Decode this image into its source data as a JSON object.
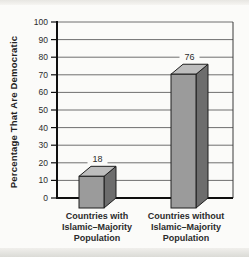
{
  "figure": {
    "background": "#fbfbf9",
    "scan_edge_top_color": "#e7e6e2",
    "scan_edge_bottom_color": "#dbdbd6"
  },
  "chart_data": {
    "type": "bar",
    "style": "3d-column",
    "title": "",
    "xlabel": "",
    "ylabel": "Percentage That Are Democratic",
    "categories": [
      "Countries with Islamic–Majority Population",
      "Countries without Islamic–Majority Population"
    ],
    "category_lines": [
      [
        "Countries with",
        "Islamic–Majority",
        "Population"
      ],
      [
        "Countries without",
        "Islamic–Majority",
        "Population"
      ]
    ],
    "values": [
      18,
      76
    ],
    "value_labels": [
      "18",
      "76"
    ],
    "ylim": [
      0,
      100
    ],
    "yticks": [
      0,
      10,
      20,
      30,
      40,
      50,
      60,
      70,
      80,
      90,
      100
    ],
    "grid": true,
    "legend_position": "none",
    "colors": {
      "bar_front": "#9b9b9b",
      "bar_top": "#bdbdbd",
      "bar_side": "#6d6d6d",
      "bar_outline": "#1e1e1e",
      "gridline": "#6f6f6f",
      "axis": "#0f0f0f",
      "plot_border": "#3a3a3a",
      "tick_text": "#2b2b2b",
      "category_text": "#333333"
    }
  }
}
